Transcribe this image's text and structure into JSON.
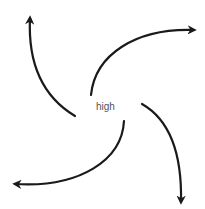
{
  "diagram": {
    "center_label": "high",
    "stroke_color": "#1a1a1a",
    "label_color": "#555555",
    "arrows": [
      {
        "name": "top-left",
        "path": "M75,116 C40,95 28,60 30,18"
      },
      {
        "name": "top-right",
        "path": "M91,95 C95,55 135,28 194,30"
      },
      {
        "name": "bottom-right",
        "path": "M142,104 C170,120 182,155 181,202"
      },
      {
        "name": "bottom-left",
        "path": "M124,121 C122,160 80,188 15,184"
      }
    ]
  }
}
